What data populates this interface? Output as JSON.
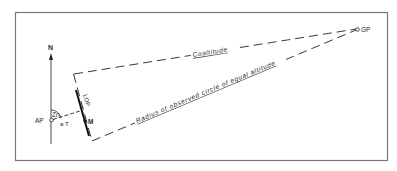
{
  "diagram": {
    "labels": {
      "north": "N",
      "ap": "AP",
      "zn": "Zn",
      "a": "a",
      "t": "T",
      "lop": "LOP",
      "m": "M",
      "gp": "GP",
      "coaltitude": "Coaltitude",
      "radius": "Radius of observed circle of equal altitude"
    },
    "colors": {
      "ink": "#2a2a2a",
      "frame": "#6e6e6e",
      "background": "#ffffff"
    }
  }
}
